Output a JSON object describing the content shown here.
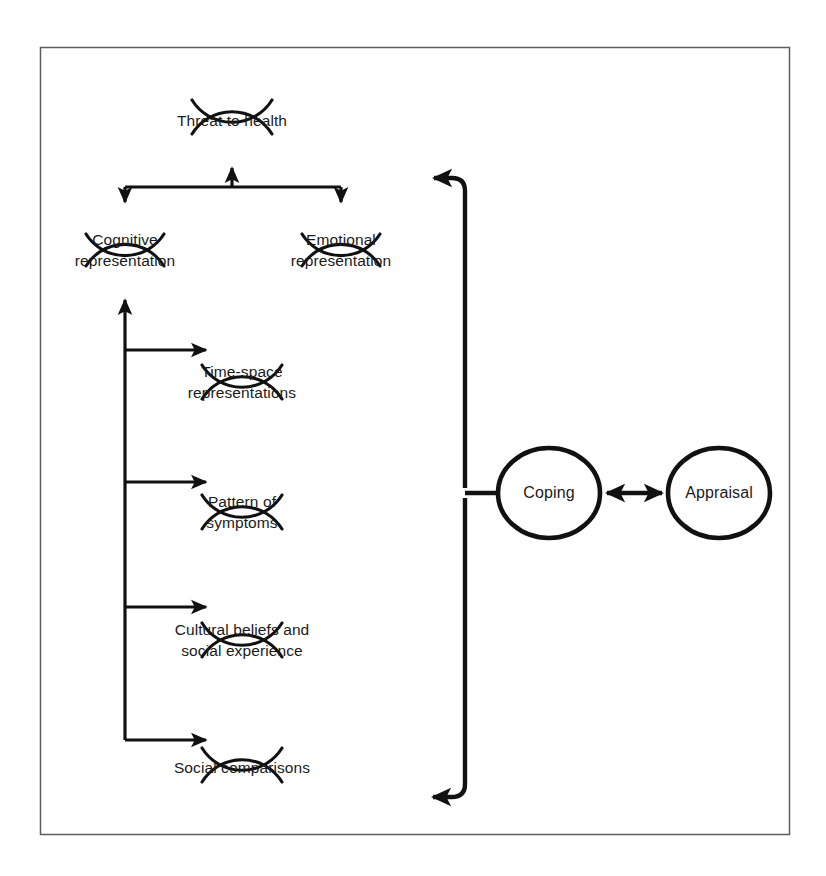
{
  "figure": {
    "frame": {
      "x": 40,
      "y": 47,
      "width": 750,
      "height": 788,
      "color": "#5d5d5d"
    },
    "stroke_color": "#111111",
    "text_color": "#1b1b1b",
    "background": "#ffffff"
  },
  "nodes": {
    "threat": {
      "id": "threat-to-health",
      "label": "Threat to health",
      "lines": [
        "Threat to health"
      ],
      "shape": "broken-circle",
      "cx": 232,
      "cy": 117,
      "r": 47
    },
    "cognitive": {
      "id": "cognitive-representation",
      "label": "Cognitive representation",
      "lines": [
        "Cognitive",
        "representation"
      ],
      "shape": "broken-circle",
      "cx": 125,
      "cy": 250,
      "r": 46
    },
    "emotional": {
      "id": "emotional-representation",
      "label": "Emotional representation",
      "lines": [
        "Emotional",
        "representation"
      ],
      "shape": "broken-circle",
      "cx": 341,
      "cy": 250,
      "r": 46
    },
    "timespace": {
      "id": "time-space-representations",
      "label": "Time-space representations",
      "lines": [
        "Time-space",
        "representations"
      ],
      "shape": "broken-circle",
      "cx": 242,
      "cy": 382,
      "r": 47
    },
    "pattern": {
      "id": "pattern-of-symptoms",
      "label": "Pattern of symptoms",
      "lines": [
        "Pattern of",
        "symptoms"
      ],
      "shape": "broken-circle",
      "cx": 242,
      "cy": 512,
      "r": 47
    },
    "cultural": {
      "id": "cultural-beliefs-and-social-experience",
      "label": "Cultural beliefs and social experience",
      "lines": [
        "Cultural beliefs and",
        "social experience"
      ],
      "shape": "broken-circle",
      "cx": 242,
      "cy": 640,
      "r": 47
    },
    "social": {
      "id": "social-comparisons",
      "label": "Social comparisons",
      "lines": [
        "Social comparisons"
      ],
      "shape": "broken-circle",
      "cx": 242,
      "cy": 765,
      "r": 47
    },
    "coping": {
      "id": "coping",
      "label": "Coping",
      "lines": [
        "Coping"
      ],
      "shape": "ellipse",
      "cx": 549,
      "cy": 493,
      "rx": 51,
      "ry": 45
    },
    "appraisal": {
      "id": "appraisal",
      "label": "Appraisal",
      "lines": [
        "Appraisal"
      ],
      "shape": "ellipse",
      "cx": 719,
      "cy": 493,
      "rx": 51,
      "ry": 45
    }
  },
  "edges": [
    {
      "id": "cognitive-to-threat",
      "from": "cognitive-representation",
      "to": "threat-to-health",
      "arrow": "single"
    },
    {
      "id": "threat-to-cognitive",
      "from": "threat-to-health",
      "to": "cognitive-representation",
      "arrow": "single"
    },
    {
      "id": "threat-to-emotional",
      "from": "threat-to-health",
      "to": "emotional-representation",
      "arrow": "single"
    },
    {
      "id": "timespace-to-cognitive",
      "from": "time-space-representations",
      "to": "cognitive-representation",
      "arrow": "single"
    },
    {
      "id": "spine-to-timespace",
      "from": "cognitive-spine",
      "to": "time-space-representations",
      "arrow": "single"
    },
    {
      "id": "spine-to-pattern",
      "from": "cognitive-spine",
      "to": "pattern-of-symptoms",
      "arrow": "single"
    },
    {
      "id": "spine-to-cultural",
      "from": "cognitive-spine",
      "to": "cultural-beliefs-and-social-experience",
      "arrow": "single"
    },
    {
      "id": "spine-to-social",
      "from": "cognitive-spine",
      "to": "social-comparisons",
      "arrow": "single"
    },
    {
      "id": "coping-to-representations-top",
      "from": "coping",
      "to": "threat-to-health-branch",
      "arrow": "single"
    },
    {
      "id": "coping-to-representations-bottom",
      "from": "coping",
      "to": "social-comparisons-branch",
      "arrow": "single"
    },
    {
      "id": "coping-appraisal",
      "from": "coping",
      "to": "appraisal",
      "arrow": "double"
    }
  ]
}
